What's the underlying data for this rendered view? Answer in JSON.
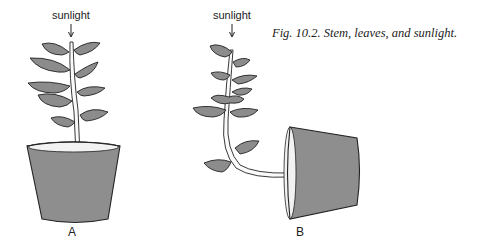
{
  "figure": {
    "caption": "Fig. 10.2.    Stem, leaves, and sunlight.",
    "panels": [
      {
        "id": "A",
        "label": "A",
        "light_label": "sunlight",
        "pot_orientation": "upright",
        "stem_shape": "straight"
      },
      {
        "id": "B",
        "label": "B",
        "light_label": "sunlight",
        "pot_orientation": "on its side",
        "stem_shape": "bent upward toward light"
      }
    ],
    "colors": {
      "pot": "#8e8e8e",
      "leaf": "#8c8c8c",
      "outline": "#222222"
    }
  }
}
